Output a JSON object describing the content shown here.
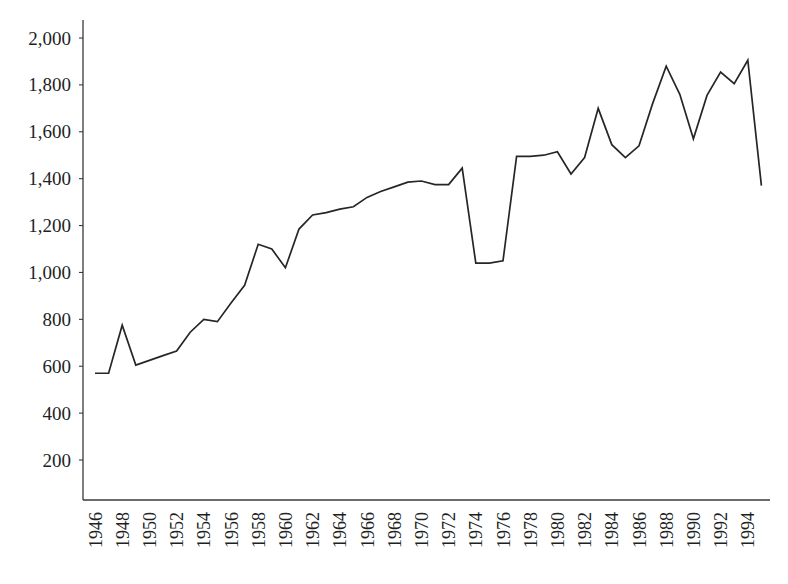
{
  "chart_data": {
    "type": "line",
    "title": "",
    "subtitle": "",
    "xlabel": "",
    "ylabel": "",
    "grid": false,
    "legend": false,
    "legend_position": "none",
    "xlim": [
      1946,
      1995
    ],
    "ylim": [
      0,
      2000
    ],
    "ytick_values": [
      200,
      400,
      600,
      800,
      1000,
      1200,
      1400,
      1600,
      1800,
      2000
    ],
    "ytick_labels": [
      "200",
      "400",
      "600",
      "800",
      "1,000",
      "1,200",
      "1,400",
      "1,600",
      "1,800",
      "2,000"
    ],
    "xtick_labels": [
      "1946",
      "1948",
      "1950",
      "1952",
      "1954",
      "1956",
      "1958",
      "1960",
      "1962",
      "1964",
      "1966",
      "1968",
      "1970",
      "1972",
      "1974",
      "1976",
      "1978",
      "1980",
      "1982",
      "1984",
      "1986",
      "1988",
      "1990",
      "1992",
      "1994"
    ],
    "xtick_values": [
      1946,
      1948,
      1950,
      1952,
      1954,
      1956,
      1958,
      1960,
      1962,
      1964,
      1966,
      1968,
      1970,
      1972,
      1974,
      1976,
      1978,
      1980,
      1982,
      1984,
      1986,
      1988,
      1990,
      1992,
      1994
    ],
    "x": [
      1946,
      1947,
      1948,
      1949,
      1950,
      1951,
      1952,
      1953,
      1954,
      1955,
      1956,
      1957,
      1958,
      1959,
      1960,
      1961,
      1962,
      1963,
      1964,
      1965,
      1966,
      1967,
      1968,
      1969,
      1970,
      1971,
      1972,
      1973,
      1974,
      1975,
      1976,
      1977,
      1978,
      1979,
      1980,
      1981,
      1982,
      1983,
      1984,
      1985,
      1986,
      1987,
      1988,
      1989,
      1990,
      1991,
      1992,
      1993,
      1994,
      1995
    ],
    "values": [
      570,
      570,
      775,
      605,
      625,
      645,
      665,
      745,
      800,
      790,
      870,
      945,
      1120,
      1100,
      1020,
      1185,
      1245,
      1255,
      1270,
      1280,
      1320,
      1345,
      1365,
      1385,
      1390,
      1375,
      1375,
      1445,
      1040,
      1040,
      1050,
      1495,
      1495,
      1500,
      1515,
      1420,
      1490,
      1700,
      1545,
      1490,
      1540,
      1720,
      1880,
      1760,
      1570,
      1755,
      1855,
      1805,
      1905,
      1370
    ],
    "series": [
      {
        "name": "series-1",
        "color": "#262626",
        "values": [
          570,
          570,
          775,
          605,
          625,
          645,
          665,
          745,
          800,
          790,
          870,
          945,
          1120,
          1100,
          1020,
          1185,
          1245,
          1255,
          1270,
          1280,
          1320,
          1345,
          1365,
          1385,
          1390,
          1375,
          1375,
          1445,
          1040,
          1040,
          1050,
          1495,
          1495,
          1500,
          1515,
          1420,
          1490,
          1700,
          1545,
          1490,
          1540,
          1720,
          1880,
          1760,
          1570,
          1755,
          1855,
          1805,
          1905,
          1370
        ]
      }
    ]
  }
}
